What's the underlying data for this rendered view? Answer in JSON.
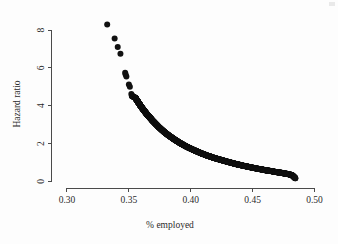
{
  "figure": {
    "background_color": "#fdfdfd",
    "point_color": "#111111",
    "axis_color": "#4a4a4a"
  },
  "chart_data": {
    "type": "scatter",
    "title": "",
    "xlabel": "% employed",
    "ylabel": "Hazard ratio",
    "xlim": [
      0.2875,
      0.5125
    ],
    "ylim": [
      -0.35,
      8.85
    ],
    "grid": false,
    "legend": null,
    "xticks": [
      0.3,
      0.35,
      0.4,
      0.45,
      0.5
    ],
    "xticklabels": [
      "0.30",
      "0.35",
      "0.40",
      "0.45",
      "0.50"
    ],
    "yticks": [
      0,
      2,
      4,
      6,
      8
    ],
    "yticklabels": [
      "0",
      "2",
      "4",
      "6",
      "8"
    ],
    "marker": "filled-circle",
    "marker_size_px": 3.0,
    "series": [
      {
        "name": "hazard ratio vs % employed",
        "x": [
          0.3325,
          0.3385,
          0.341,
          0.3432,
          0.347,
          0.3474,
          0.348,
          0.35,
          0.3508,
          0.352,
          0.3524,
          0.3552,
          0.3558,
          0.3564,
          0.357,
          0.3576,
          0.3582,
          0.3588,
          0.3594,
          0.36,
          0.3607,
          0.3614,
          0.3621,
          0.3628,
          0.3635,
          0.3642,
          0.365,
          0.3658,
          0.3666,
          0.3674,
          0.3682,
          0.369,
          0.3699,
          0.3708,
          0.3717,
          0.3726,
          0.3735,
          0.3744,
          0.3754,
          0.3764,
          0.3774,
          0.3784,
          0.3794,
          0.3804,
          0.3815,
          0.3826,
          0.3837,
          0.3848,
          0.3859,
          0.387,
          0.3882,
          0.3894,
          0.3906,
          0.3918,
          0.393,
          0.3942,
          0.3955,
          0.3968,
          0.3981,
          0.3994,
          0.4007,
          0.402,
          0.4034,
          0.4048,
          0.4062,
          0.4076,
          0.409,
          0.4104,
          0.4119,
          0.4134,
          0.4149,
          0.4164,
          0.4179,
          0.4194,
          0.421,
          0.4226,
          0.4242,
          0.4258,
          0.4274,
          0.429,
          0.4307,
          0.4324,
          0.4341,
          0.4358,
          0.4375,
          0.4392,
          0.441,
          0.4428,
          0.4446,
          0.4464,
          0.4482,
          0.45,
          0.4519,
          0.4538,
          0.4557,
          0.4576,
          0.4595,
          0.4614,
          0.4634,
          0.4654,
          0.4674,
          0.4694,
          0.4714,
          0.4734,
          0.4755,
          0.4776,
          0.4797,
          0.4818,
          0.4832,
          0.4845
        ],
        "y": [
          8.3,
          7.55,
          7.1,
          6.75,
          5.75,
          5.65,
          5.55,
          5.12,
          5.0,
          4.62,
          4.52,
          4.42,
          4.36,
          4.3,
          4.24,
          4.18,
          4.12,
          4.06,
          4.0,
          3.94,
          3.88,
          3.82,
          3.76,
          3.7,
          3.64,
          3.58,
          3.52,
          3.46,
          3.4,
          3.34,
          3.28,
          3.22,
          3.16,
          3.1,
          3.04,
          2.98,
          2.92,
          2.86,
          2.8,
          2.74,
          2.68,
          2.62,
          2.57,
          2.52,
          2.46,
          2.41,
          2.36,
          2.31,
          2.26,
          2.21,
          2.16,
          2.11,
          2.06,
          2.01,
          1.97,
          1.92,
          1.88,
          1.83,
          1.79,
          1.75,
          1.71,
          1.67,
          1.63,
          1.59,
          1.55,
          1.51,
          1.47,
          1.44,
          1.4,
          1.36,
          1.33,
          1.3,
          1.26,
          1.23,
          1.2,
          1.17,
          1.14,
          1.11,
          1.08,
          1.05,
          1.02,
          0.99,
          0.96,
          0.93,
          0.9,
          0.88,
          0.85,
          0.82,
          0.8,
          0.77,
          0.75,
          0.72,
          0.7,
          0.67,
          0.65,
          0.63,
          0.6,
          0.58,
          0.56,
          0.54,
          0.51,
          0.49,
          0.47,
          0.45,
          0.42,
          0.4,
          0.37,
          0.33,
          0.25,
          0.16
        ]
      }
    ]
  }
}
